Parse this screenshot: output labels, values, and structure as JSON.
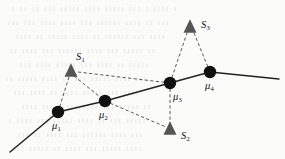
{
  "figure": {
    "width": 285,
    "height": 159,
    "background_color": "#fbfbfa"
  },
  "style": {
    "marker_circle_color": "#111111",
    "marker_triangle_color": "#555555",
    "solid_line_color": "#222222",
    "dashed_line_color": "#444444",
    "label_color": "#111111",
    "bleed_text_color": "#cfc9c6"
  },
  "chart_data": {
    "type": "scatter",
    "xlabel": "",
    "ylabel": "",
    "xlim": [
      0,
      285
    ],
    "ylim": [
      0,
      159
    ],
    "grid": false,
    "legend": "none",
    "series": [
      {
        "name": "trajectory-means",
        "marker": "circle",
        "color": "#111111",
        "points": [
          {
            "id": "mu1",
            "label": "μ",
            "sub": "1",
            "x": 58,
            "y": 112,
            "label_x": 52,
            "label_y": 121
          },
          {
            "id": "mu2",
            "label": "μ",
            "sub": "2",
            "x": 105,
            "y": 101,
            "label_x": 99,
            "label_y": 110
          },
          {
            "id": "mu3",
            "label": "μ",
            "sub": "3",
            "x": 170,
            "y": 83,
            "label_x": 173,
            "label_y": 92
          },
          {
            "id": "mu4",
            "label": "μ",
            "sub": "4",
            "x": 210,
            "y": 72,
            "label_x": 205,
            "label_y": 81
          }
        ]
      },
      {
        "name": "sensors",
        "marker": "triangle",
        "color": "#555555",
        "points": [
          {
            "id": "s1",
            "label": "S",
            "sub": "1",
            "x": 71,
            "y": 71,
            "label_x": 76,
            "label_y": 52
          },
          {
            "id": "s2",
            "label": "S",
            "sub": "2",
            "x": 170,
            "y": 129,
            "label_x": 181,
            "label_y": 131
          },
          {
            "id": "s3",
            "label": "S",
            "sub": "3",
            "x": 190,
            "y": 27,
            "label_x": 201,
            "label_y": 20
          }
        ]
      }
    ],
    "solid_path": {
      "name": "trajectory-polyline",
      "style": "solid",
      "points": [
        {
          "x": 10,
          "y": 152
        },
        {
          "x": 58,
          "y": 112
        },
        {
          "x": 105,
          "y": 101
        },
        {
          "x": 170,
          "y": 83
        },
        {
          "x": 210,
          "y": 72
        },
        {
          "x": 279,
          "y": 79
        }
      ]
    },
    "dashed_edges": [
      {
        "name": "edge-s1-mu1",
        "from": "s1",
        "to": "mu1",
        "x1": 69,
        "y1": 77,
        "x2": 58,
        "y2": 112
      },
      {
        "name": "edge-s1-mu3",
        "from": "s1",
        "to": "mu3",
        "x1": 78,
        "y1": 72,
        "x2": 170,
        "y2": 83
      },
      {
        "name": "edge-s1-mu2",
        "from": "s1",
        "to": "mu2",
        "x1": 74,
        "y1": 76,
        "x2": 105,
        "y2": 101
      },
      {
        "name": "edge-mu2-s2",
        "from": "mu2",
        "to": "s2",
        "x1": 105,
        "y1": 101,
        "x2": 166,
        "y2": 127
      },
      {
        "name": "edge-mu3-s2",
        "from": "mu3",
        "to": "s2",
        "x1": 170,
        "y1": 83,
        "x2": 170,
        "y2": 124
      },
      {
        "name": "edge-mu3-s3",
        "from": "mu3",
        "to": "s3",
        "x1": 170,
        "y1": 83,
        "x2": 187,
        "y2": 33
      },
      {
        "name": "edge-mu4-s3",
        "from": "mu4",
        "to": "s3",
        "x1": 210,
        "y1": 72,
        "x2": 194,
        "y2": 33
      }
    ]
  },
  "background_bleed": {
    "lines": [
      {
        "text": "ı ıııı ı ııı ııııı ıııı ııııı ııı ıı ıı ı",
        "x": 10,
        "y": 5
      },
      {
        "text": "ııı ıı ıııı ıııııı ııı ıııı ıııı ııı ııı",
        "x": 6,
        "y": 19
      },
      {
        "text": "ıııı ııı ıııııı ıı ıııı ııııı ıı ıııı",
        "x": 14,
        "y": 33
      },
      {
        "text": "ıı ııııı ııı ıııı ıııııı ııı ıııı ıı",
        "x": 8,
        "y": 47
      },
      {
        "text": "ııııı ıı ıııı ııı ııııı ıııı ııı",
        "x": 18,
        "y": 61
      },
      {
        "text": "ııı ıııı ııııı ııı ıı ıııı ııııı ıı",
        "x": 4,
        "y": 75
      },
      {
        "text": "ıııı ııı ııııı ıııı ıı ıııı ııı",
        "x": 12,
        "y": 89
      },
      {
        "text": "ıı ııııı ııı ıııı ııııı ııı ıııı",
        "x": 20,
        "y": 103
      },
      {
        "text": "ııııı ııı ıı ıııı ııııı ııı ıııı ı",
        "x": 7,
        "y": 117
      },
      {
        "text": "ııı ıııı ıııııı ııı ıııı ıı ııı",
        "x": 16,
        "y": 131
      },
      {
        "text": "ıııı ııııı ııı ıııı ıı ııııı ııı",
        "x": 11,
        "y": 145
      }
    ]
  }
}
